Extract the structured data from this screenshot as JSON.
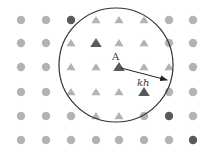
{
  "diagram": {
    "grid": {
      "columns_x": [
        21,
        46,
        71,
        96,
        119,
        144,
        169,
        193
      ],
      "rows_y": [
        20,
        43,
        67,
        92,
        116,
        140
      ],
      "cells": [
        [
          "circle",
          "circle",
          "circle-dark",
          "triangle",
          "triangle",
          "triangle",
          "circle",
          "circle"
        ],
        [
          "circle",
          "circle",
          "triangle",
          "triangle-dark",
          "triangle",
          "triangle",
          "circle",
          "circle"
        ],
        [
          "circle",
          "circle",
          "triangle",
          "triangle",
          "triangle-dark",
          "triangle",
          "triangle",
          "circle"
        ],
        [
          "circle",
          "circle",
          "triangle",
          "triangle",
          "triangle",
          "triangle-dark",
          "circle",
          "circle"
        ],
        [
          "circle",
          "circle",
          "circle",
          "triangle",
          "triangle",
          "circle",
          "circle-dark",
          "circle"
        ],
        [
          "circle",
          "circle",
          "circle",
          "circle",
          "circle",
          "circle",
          "circle",
          "circle-dark"
        ]
      ]
    },
    "neighborhood_circle": {
      "cx": 116,
      "cy": 65,
      "r": 57
    },
    "center_point": {
      "label": "A",
      "x": 119,
      "y": 67
    },
    "radius_arrow": {
      "label": "kh",
      "x1": 121,
      "y1": 68,
      "x2": 167,
      "y2": 80
    },
    "colors": {
      "light_marker": "#b3b3b3",
      "dark_marker": "#5a5a5a",
      "outline": "#333333"
    }
  }
}
